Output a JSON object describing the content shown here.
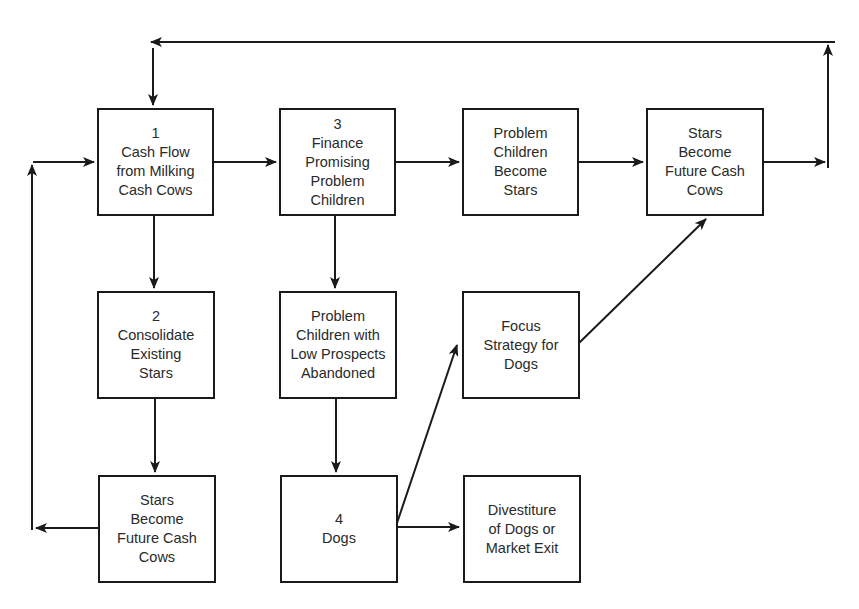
{
  "diagram": {
    "type": "flowchart",
    "colors": {
      "stroke": "#1a1a1a",
      "background": "#ffffff",
      "text": "#2a2a2a"
    },
    "nodes": [
      {
        "id": "cash-flow",
        "label": "1\nCash Flow\nfrom Milking\nCash Cows"
      },
      {
        "id": "finance-problem-children",
        "label": "3\nFinance\nPromising\nProblem\nChildren"
      },
      {
        "id": "problem-children-become-stars",
        "label": "Problem\nChildren\nBecome\nStars"
      },
      {
        "id": "stars-become-cash-cows-top",
        "label": "Stars\nBecome\nFuture Cash\nCows"
      },
      {
        "id": "consolidate-stars",
        "label": "2\nConsolidate\nExisting\nStars"
      },
      {
        "id": "low-prospects-abandoned",
        "label": "Problem\nChildren with\nLow Prospects\nAbandoned"
      },
      {
        "id": "focus-strategy-dogs",
        "label": "Focus\nStrategy for\nDogs"
      },
      {
        "id": "stars-become-cash-cows-bottom",
        "label": "Stars\nBecome\nFuture Cash\nCows"
      },
      {
        "id": "dogs",
        "label": "4\nDogs"
      },
      {
        "id": "divestiture",
        "label": "Divestiture\nof Dogs or\nMarket Exit"
      }
    ],
    "edges": [
      {
        "from": "cash-flow",
        "to": "finance-problem-children"
      },
      {
        "from": "finance-problem-children",
        "to": "problem-children-become-stars"
      },
      {
        "from": "problem-children-become-stars",
        "to": "stars-become-cash-cows-top"
      },
      {
        "from": "stars-become-cash-cows-top",
        "to": "cash-flow",
        "route": "top feedback loop"
      },
      {
        "from": "cash-flow",
        "to": "consolidate-stars"
      },
      {
        "from": "consolidate-stars",
        "to": "stars-become-cash-cows-bottom"
      },
      {
        "from": "stars-become-cash-cows-bottom",
        "to": "cash-flow",
        "route": "left feedback loop"
      },
      {
        "from": "finance-problem-children",
        "to": "low-prospects-abandoned"
      },
      {
        "from": "low-prospects-abandoned",
        "to": "dogs"
      },
      {
        "from": "dogs",
        "to": "focus-strategy-dogs"
      },
      {
        "from": "dogs",
        "to": "divestiture"
      },
      {
        "from": "focus-strategy-dogs",
        "to": "stars-become-cash-cows-top"
      }
    ]
  }
}
